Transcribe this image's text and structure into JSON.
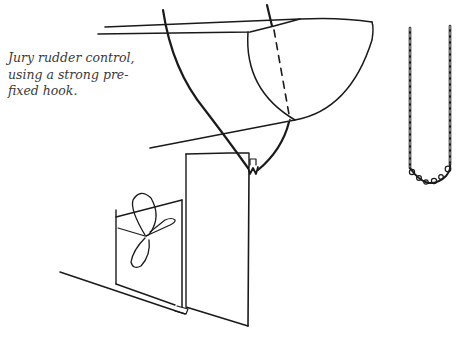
{
  "figure": {
    "caption_lines": [
      "Jury rudder control,",
      "using a strong pre-",
      "fixed hook."
    ],
    "elements": [
      "hull-stern",
      "steering-lines",
      "hook",
      "jury-rudder-board",
      "propeller",
      "keel-line",
      "chain-detail"
    ],
    "colors": {
      "ink": "#1a1a1a",
      "background": "#ffffff"
    }
  }
}
